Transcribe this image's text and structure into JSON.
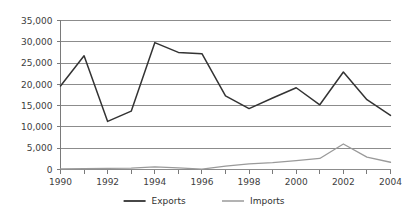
{
  "chart_data": {
    "type": "line",
    "title": "",
    "subtitle": "",
    "xlabel": "",
    "ylabel": "",
    "x": [
      1990,
      1991,
      1992,
      1993,
      1994,
      1995,
      1996,
      1997,
      1998,
      1999,
      2000,
      2001,
      2002,
      2003,
      2004
    ],
    "categories": [
      "1990",
      "1991",
      "1992",
      "1993",
      "1994",
      "1995",
      "1996",
      "1997",
      "1998",
      "1999",
      "2000",
      "2001",
      "2002",
      "2003",
      "2004"
    ],
    "series": [
      {
        "name": "Exports",
        "color": "#333333",
        "values": [
          19600,
          26700,
          11300,
          13700,
          29800,
          27500,
          27200,
          17300,
          14300,
          16800,
          19200,
          15200,
          22900,
          16400,
          12700
        ]
      },
      {
        "name": "Imports",
        "color": "#9a9a9a",
        "values": [
          150,
          200,
          250,
          300,
          600,
          400,
          100,
          800,
          1300,
          1600,
          2100,
          2600,
          6000,
          2900,
          1700
        ]
      }
    ],
    "ylim": [
      0,
      35000
    ],
    "ytick_values": [
      0,
      5000,
      10000,
      15000,
      20000,
      25000,
      30000,
      35000
    ],
    "ytick_labels": [
      "0",
      "5,000",
      "10,000",
      "15,000",
      "20,000",
      "25,000",
      "30,000",
      "35,000"
    ],
    "xtick_labels": [
      "1990",
      "1992",
      "1994",
      "1996",
      "1998",
      "2000",
      "2002",
      "2004"
    ],
    "xtick_values": [
      1990,
      1992,
      1994,
      1996,
      1998,
      2000,
      2002,
      2004
    ],
    "xlim": [
      1990,
      2004
    ],
    "grid": true,
    "grid_axis": "y",
    "grid_color": "#8c8c8c",
    "axis_color": "#7a7a7a",
    "legend": true,
    "legend_position": "bottom-center",
    "legend_entries": [
      {
        "label": "Exports",
        "color": "#333333"
      },
      {
        "label": "Imports",
        "color": "#9a9a9a"
      }
    ],
    "background_color": "#ffffff"
  }
}
